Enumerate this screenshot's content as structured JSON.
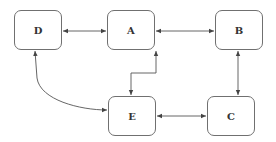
{
  "diagram": {
    "nodes": [
      {
        "id": "D",
        "label": "D",
        "x": 14,
        "y": 10,
        "w": 48,
        "h": 40
      },
      {
        "id": "A",
        "label": "A",
        "x": 107,
        "y": 10,
        "w": 48,
        "h": 40
      },
      {
        "id": "B",
        "label": "B",
        "x": 215,
        "y": 10,
        "w": 48,
        "h": 40
      },
      {
        "id": "E",
        "label": "E",
        "x": 108,
        "y": 96,
        "w": 48,
        "h": 40
      },
      {
        "id": "C",
        "label": "C",
        "x": 207,
        "y": 96,
        "w": 48,
        "h": 40
      }
    ],
    "edges": [
      {
        "from": "D",
        "to": "A",
        "direction": "both"
      },
      {
        "from": "A",
        "to": "B",
        "direction": "both"
      },
      {
        "from": "A",
        "to": "E",
        "direction": "both"
      },
      {
        "from": "D",
        "to": "E",
        "direction": "both"
      },
      {
        "from": "B",
        "to": "C",
        "direction": "both"
      },
      {
        "from": "E",
        "to": "C",
        "direction": "both"
      }
    ],
    "colors": {
      "edge": "#555555",
      "border": "#707070",
      "text": "#333333"
    }
  }
}
